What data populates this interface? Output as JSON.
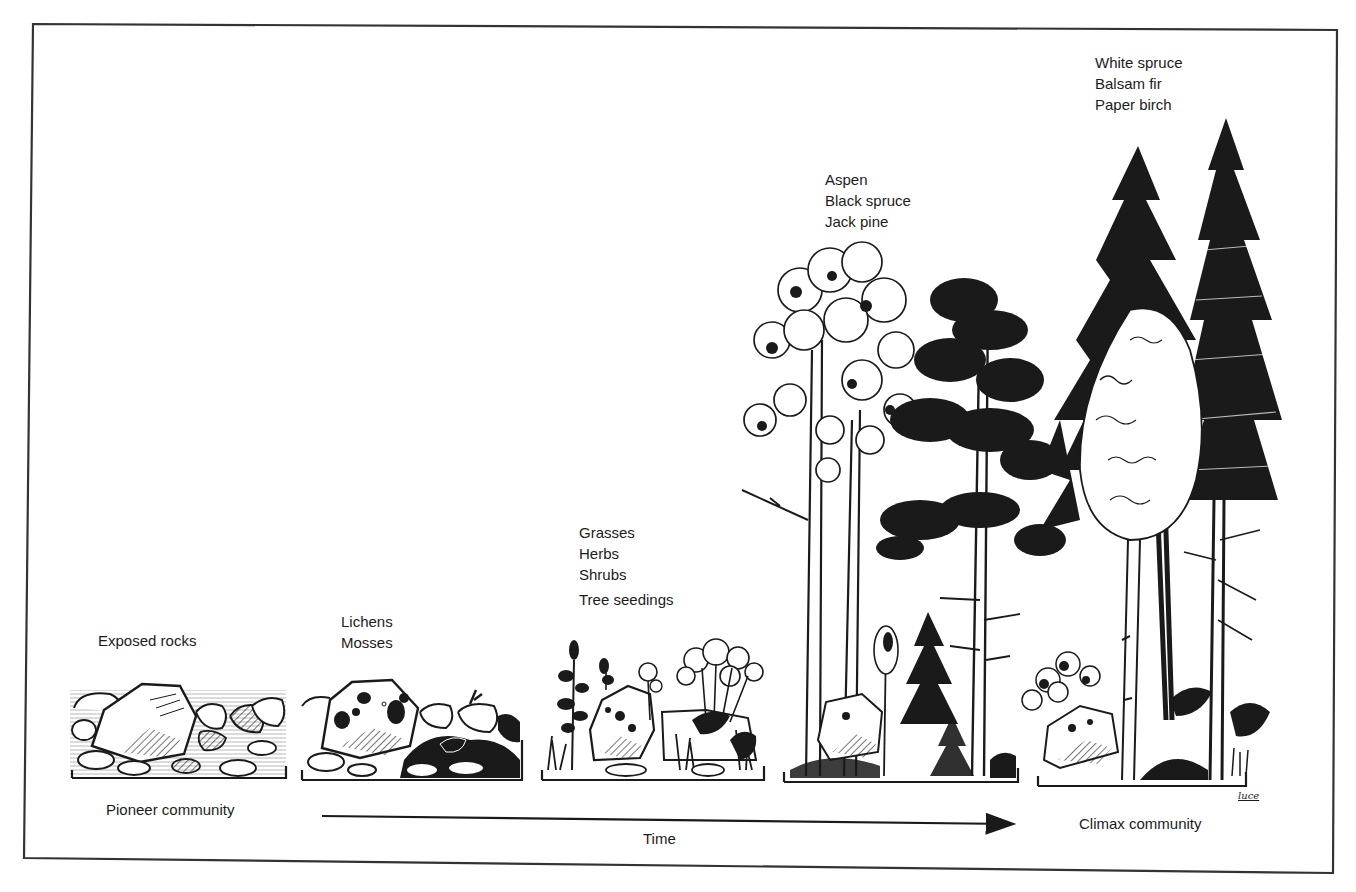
{
  "figure": {
    "type": "ecological-succession-diagram",
    "stages": [
      {
        "id": "stage-1",
        "labels": [
          "Exposed rocks"
        ]
      },
      {
        "id": "stage-2",
        "labels": [
          "Lichens",
          "Mosses"
        ]
      },
      {
        "id": "stage-3",
        "labels": [
          "Grasses",
          "Herbs",
          "Shrubs",
          "Tree seedings"
        ]
      },
      {
        "id": "stage-4",
        "labels": [
          "Aspen",
          "Black spruce",
          "Jack pine"
        ]
      },
      {
        "id": "stage-5",
        "labels": [
          "White spruce",
          "Balsam fir",
          "Paper birch"
        ]
      }
    ],
    "start_caption": "Pioneer community",
    "end_caption": "Climax community",
    "axis_label": "Time",
    "artist_signature": "luce",
    "colors": {
      "ink": "#1a1a1a",
      "paper": "#ffffff",
      "border": "#333333"
    }
  }
}
